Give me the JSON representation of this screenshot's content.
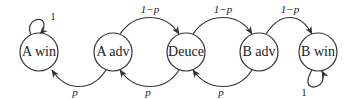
{
  "diagram": {
    "type": "markov-chain",
    "states": [
      {
        "id": "a_win",
        "label": "A win"
      },
      {
        "id": "a_adv",
        "label": "A adv"
      },
      {
        "id": "deuce",
        "label": "Deuce"
      },
      {
        "id": "b_adv",
        "label": "B adv"
      },
      {
        "id": "b_win",
        "label": "B win"
      }
    ],
    "edges": [
      {
        "from": "a_win",
        "to": "a_win",
        "label": "1"
      },
      {
        "from": "a_adv",
        "to": "deuce",
        "label": "1−p"
      },
      {
        "from": "deuce",
        "to": "b_adv",
        "label": "1−p"
      },
      {
        "from": "b_adv",
        "to": "b_win",
        "label": "1−p"
      },
      {
        "from": "a_adv",
        "to": "a_win",
        "label": "p"
      },
      {
        "from": "deuce",
        "to": "a_adv",
        "label": "p"
      },
      {
        "from": "b_adv",
        "to": "deuce",
        "label": "p"
      },
      {
        "from": "b_win",
        "to": "b_win",
        "label": "1"
      }
    ]
  }
}
